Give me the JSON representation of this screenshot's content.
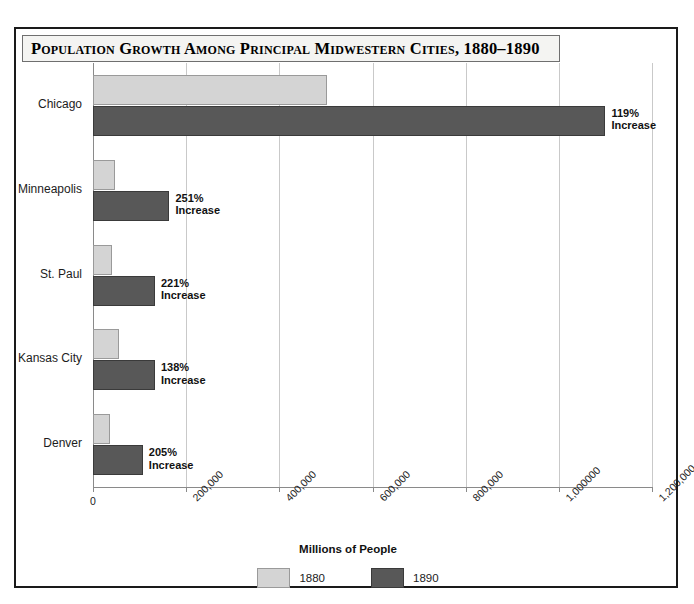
{
  "figure": {
    "title": "Population Growth Among Principal Midwestern Cities, 1880–1890"
  },
  "axis": {
    "x_title": "Millions of People",
    "x_ticks": [
      "0",
      "200,000",
      "400,000",
      "600,000",
      "800,000",
      "1,000000",
      "1,200,000"
    ]
  },
  "legend": {
    "entries": [
      {
        "label": "1880",
        "color": "#d4d4d4"
      },
      {
        "label": "1890",
        "color": "#585858"
      }
    ]
  },
  "categories": [
    "Chicago",
    "Minneapolis",
    "St. Paul",
    "Kansas City",
    "Denver"
  ],
  "annotations": [
    {
      "pct": "119%",
      "word": "Increase"
    },
    {
      "pct": "251%",
      "word": "Increase"
    },
    {
      "pct": "221%",
      "word": "Increase"
    },
    {
      "pct": "138%",
      "word": "Increase"
    },
    {
      "pct": "205%",
      "word": "Increase"
    }
  ],
  "chart_data": {
    "type": "bar",
    "orientation": "horizontal",
    "title": "Population Growth Among Principal Midwestern Cities, 1880–1890",
    "xlabel": "Millions of People",
    "ylabel": "",
    "categories": [
      "Chicago",
      "Minneapolis",
      "St. Paul",
      "Kansas City",
      "Denver"
    ],
    "series": [
      {
        "name": "1880",
        "color": "#d4d4d4",
        "values": [
          503000,
          47000,
          41000,
          56000,
          36000
        ]
      },
      {
        "name": "1890",
        "color": "#585858",
        "values": [
          1100000,
          164000,
          133000,
          133000,
          107000
        ]
      }
    ],
    "data_labels": [
      "119% Increase",
      "251% Increase",
      "221% Increase",
      "138% Increase",
      "205% Increase"
    ],
    "xlim": [
      0,
      1200000
    ],
    "xticks": [
      0,
      200000,
      400000,
      600000,
      800000,
      1000000,
      1200000
    ],
    "xtick_labels": [
      "0",
      "200,000",
      "400,000",
      "600,000",
      "800,000",
      "1,000000",
      "1,200,000"
    ],
    "grid": "vertical",
    "legend_position": "bottom-center"
  },
  "artifact": {
    "text": ""
  }
}
